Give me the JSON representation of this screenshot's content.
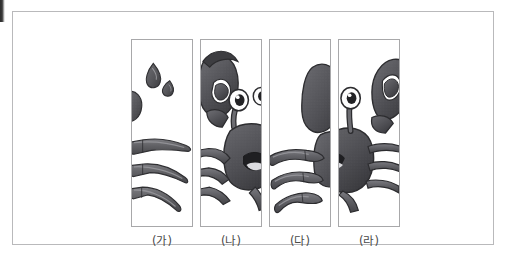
{
  "page": {
    "background_color": "#ffffff",
    "frame_border_color": "#b9b9bb",
    "artifact_label": "scan-edge-mark"
  },
  "figure": {
    "panel_border_color": "#a8a8aa",
    "ink_color": "#3a3a3c",
    "shell_color": "#5a5a5e",
    "highlight_color": "#8e8e92",
    "eye_white_color": "#fdfdfd",
    "mouth_color": "#d9d9dc"
  },
  "panels": [
    {
      "label": "(가)",
      "name": "panel-ga",
      "contents": "two water droplets and three left legs"
    },
    {
      "label": "(나)",
      "name": "panel-na",
      "contents": "left claw raised, eye on stalk, open mouth and body"
    },
    {
      "label": "(다)",
      "name": "panel-da",
      "contents": "three right legs and edge of right claw"
    },
    {
      "label": "(라)",
      "name": "panel-ra",
      "contents": "right eye, right claw, body and trailing legs"
    }
  ]
}
